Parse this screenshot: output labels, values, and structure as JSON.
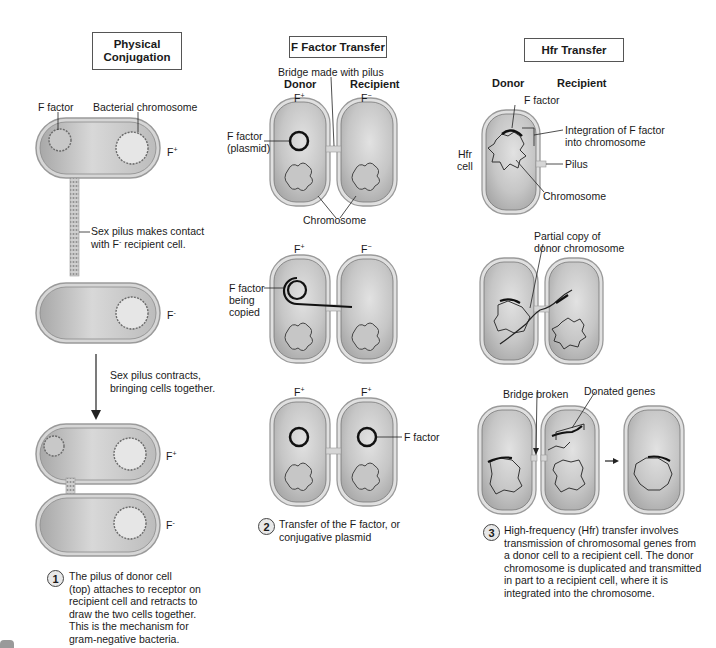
{
  "panels": {
    "physical": {
      "title_line1": "Physical",
      "title_line2": "Conjugation",
      "labels": {
        "f_factor": "F factor",
        "bacterial_chromosome": "Bacterial chromosome",
        "f_plus": "F",
        "f_plus_sup": "+",
        "f_minus": "F",
        "f_minus_sup": "-",
        "pilus_contact_line1": "Sex pilus makes contact",
        "pilus_contact_line2": "with F",
        "pilus_contact_sup": "-",
        "pilus_contact_line2b": " recipient cell.",
        "contracts_line1": "Sex pilus contracts,",
        "contracts_line2": "bringing cells together."
      },
      "step_number": "1",
      "caption": [
        "The pilus of donor cell",
        "(top) attaches to receptor on",
        "recipient cell and retracts to",
        "draw the two cells together.",
        "This is the mechanism for",
        "gram-negative bacteria."
      ]
    },
    "f_factor_transfer": {
      "title": "F Factor Transfer",
      "labels": {
        "bridge": "Bridge made with pilus",
        "donor": "Donor",
        "recipient": "Recipient",
        "f": "F",
        "plus": "+",
        "minus": "−",
        "f_factor_plasmid_line1": "F factor",
        "f_factor_plasmid_line2": "(plasmid)",
        "chromosome": "Chromosome",
        "being_copied_line1": "F factor",
        "being_copied_line2": "being",
        "being_copied_line3": "copied",
        "f_factor": "F factor"
      },
      "step_number": "2",
      "caption": [
        "Transfer of the F factor, or",
        "conjugative plasmid"
      ]
    },
    "hfr_transfer": {
      "title": "Hfr Transfer",
      "labels": {
        "donor": "Donor",
        "recipient": "Recipient",
        "f_factor": "F factor",
        "integration_line1": "Integration of F factor",
        "integration_line2": "into chromosome",
        "hfr_cell_line1": "Hfr",
        "hfr_cell_line2": "cell",
        "pilus": "Pilus",
        "chromosome": "Chromosome",
        "partial_copy_line1": "Partial copy of",
        "partial_copy_line2": "donor chromosome",
        "bridge_broken": "Bridge broken",
        "donated_genes": "Donated genes"
      },
      "step_number": "3",
      "caption": [
        "High-frequency (Hfr) transfer involves",
        "transmission of chromosomal genes from",
        "a donor cell to a recipient cell. The donor",
        "chromosome is duplicated and transmitted",
        "in part to a recipient cell, where it is",
        "integrated into the chromosome."
      ]
    }
  },
  "colors": {
    "cell_fill": "#b9b9b9",
    "cell_light": "#dcdcdc",
    "cell_border": "#8a8a8a",
    "outline": "#555555",
    "line": "#222222"
  }
}
